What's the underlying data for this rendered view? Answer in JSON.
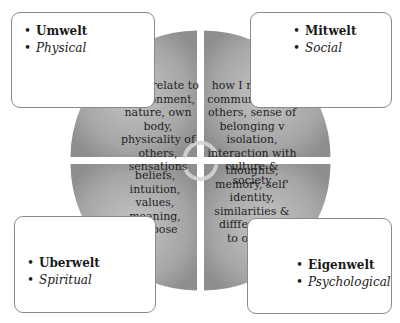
{
  "diagram": {
    "quadrants": [
      {
        "position": "top-left",
        "title": "Umwelt",
        "subtitle": "Physical",
        "description": "how I relate to environment, nature, own body, physicality of others, sensations"
      },
      {
        "position": "top-right",
        "title": "Mitwelt",
        "subtitle": "Social",
        "description": "how I relate & communicate to others, sense of belonging v isolation, interaction with culture & society"
      },
      {
        "position": "bottom-left",
        "title": "Uberwelt",
        "subtitle": "Spiritual",
        "description": "beliefs, intuition, values, meaning, purpose"
      },
      {
        "position": "bottom-right",
        "title": "Eigenwelt",
        "subtitle": "Psychological",
        "description": "thoughts, memory, self' identity, similarities & diffferences to others"
      }
    ],
    "center_icon": "circular-arrows-icon",
    "colors": {
      "quadrant_fill": "#9e9e9e",
      "quadrant_fill_light": "#bdbdbd",
      "box_border": "#8a8a8a",
      "gap": "#ffffff"
    }
  }
}
